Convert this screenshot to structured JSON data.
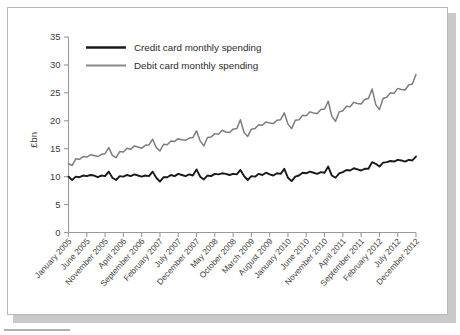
{
  "chart_data": {
    "type": "line",
    "title": "",
    "xlabel": "",
    "ylabel": "£bn",
    "ylim": [
      0,
      35
    ],
    "yticks": [
      0,
      5,
      10,
      15,
      20,
      25,
      30,
      35
    ],
    "grid": false,
    "legend_position": "top-left",
    "xtick_labels": [
      "January 2005",
      "June 2005",
      "November 2005",
      "April 2006",
      "September 2006",
      "February 2007",
      "July 2007",
      "December 2007",
      "May 2008",
      "October 2008",
      "March 2009",
      "August 2009",
      "January 2010",
      "June 2010",
      "November 2010",
      "April 2011",
      "September 2011",
      "February 2012",
      "July 2012",
      "December 2012"
    ],
    "xtick_interval_months": 5,
    "x_start": "January 2005",
    "x_end": "December 2012",
    "n_points": 96,
    "series": [
      {
        "name": "Credit card monthly spending",
        "color": "#191919",
        "values": [
          10.0,
          9.4,
          10.0,
          9.9,
          10.2,
          10.1,
          10.3,
          10.2,
          9.9,
          10.2,
          10.1,
          10.9,
          9.8,
          9.4,
          10.1,
          10.0,
          10.3,
          10.1,
          10.4,
          10.2,
          10.0,
          10.2,
          10.1,
          10.9,
          9.8,
          9.1,
          9.9,
          9.9,
          10.3,
          10.1,
          10.5,
          10.3,
          10.1,
          10.4,
          10.2,
          11.3,
          10.0,
          9.5,
          10.2,
          10.1,
          10.5,
          10.4,
          10.6,
          10.5,
          10.3,
          10.5,
          10.4,
          11.2,
          10.1,
          9.4,
          10.1,
          10.0,
          10.5,
          10.3,
          10.7,
          10.4,
          10.2,
          10.6,
          10.5,
          11.4,
          9.8,
          9.2,
          10.0,
          10.2,
          10.7,
          10.6,
          10.9,
          10.7,
          10.5,
          10.8,
          10.7,
          11.8,
          10.2,
          9.8,
          10.6,
          10.8,
          11.2,
          11.1,
          11.5,
          11.3,
          11.1,
          11.4,
          11.4,
          12.6,
          12.3,
          11.8,
          12.5,
          12.6,
          12.8,
          12.7,
          13.0,
          12.9,
          12.7,
          13.0,
          12.9,
          13.6
        ]
      },
      {
        "name": "Debit card monthly spending",
        "color": "#7d7d7d",
        "values": [
          12.3,
          12.0,
          13.2,
          13.1,
          13.6,
          13.5,
          13.9,
          13.8,
          13.6,
          14.0,
          14.1,
          15.2,
          13.8,
          13.4,
          14.5,
          14.4,
          15.1,
          14.9,
          15.5,
          15.3,
          15.1,
          15.6,
          15.7,
          16.7,
          15.2,
          14.6,
          15.8,
          15.7,
          16.4,
          16.3,
          16.8,
          16.6,
          16.5,
          16.9,
          17.0,
          18.2,
          16.4,
          15.5,
          17.0,
          17.1,
          17.7,
          17.6,
          18.3,
          18.0,
          17.9,
          18.5,
          18.6,
          20.2,
          17.9,
          17.2,
          18.5,
          18.6,
          19.3,
          19.2,
          19.8,
          19.6,
          19.5,
          20.1,
          20.2,
          21.4,
          19.4,
          18.6,
          20.1,
          20.2,
          21.0,
          20.9,
          21.6,
          21.4,
          21.3,
          22.0,
          22.1,
          23.5,
          20.8,
          19.9,
          21.6,
          21.8,
          22.6,
          22.5,
          23.3,
          23.1,
          23.0,
          23.8,
          24.0,
          25.7,
          22.9,
          22.0,
          24.0,
          24.2,
          25.0,
          24.9,
          25.8,
          25.6,
          25.5,
          26.4,
          26.6,
          28.3
        ]
      }
    ]
  },
  "legend": {
    "entries": [
      {
        "label": "Credit card monthly spending"
      },
      {
        "label": "Debit card monthly spending"
      }
    ]
  },
  "axes": {
    "y_title": "£bn",
    "y_tick_labels": [
      "0",
      "5",
      "10",
      "15",
      "20",
      "25",
      "30",
      "35"
    ]
  }
}
